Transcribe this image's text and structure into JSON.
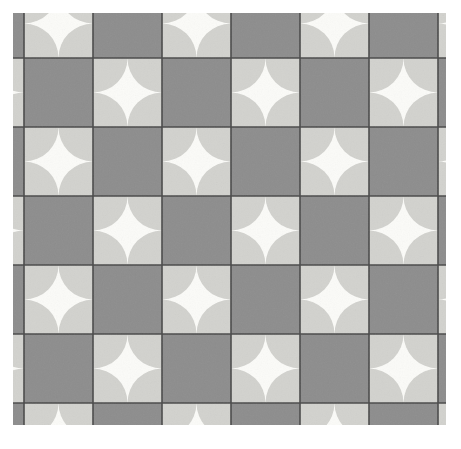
{
  "figure": {
    "kind": "geometric-tiling",
    "canvas": {
      "width": 461,
      "height": 449,
      "background": "#ffffff"
    }
  },
  "viewport": {
    "x": 13,
    "y": 13,
    "width": 433,
    "height": 412,
    "label": "clipped pattern region"
  },
  "grid": {
    "cell_size": 69,
    "origin_x": 24,
    "origin_y": 58,
    "columns": 7,
    "rows": 7,
    "line_color": "#4a4a4a",
    "line_width": 1.6,
    "vertical_lines": [
      24,
      93,
      162,
      231,
      300,
      369,
      438
    ],
    "horizontal_lines": [
      58,
      127,
      196,
      265,
      334,
      403
    ]
  },
  "colors": {
    "dark_tile": "#8d8d8d",
    "light_tile": "#d2d2ce",
    "star_fill": "#fbfbf8",
    "grid_line": "#4a4a4a",
    "page_background": "#ffffff",
    "grain": "#9a9a95"
  },
  "motif": {
    "name": "astroid-star",
    "description": "Four quarter-circle arcs inset from the tile corners carve a concave four-pointed white star.",
    "corner_radius_ratio": 0.5
  },
  "parity": {
    "description": "Checkerboard: tiles where (column + row) is even are dark solid; odd tiles are light with a white astroid star.",
    "dark_when_sum_even": true
  },
  "legend": {
    "dark_label": "solid dark tile",
    "light_label": "light tile with white star",
    "visible": false
  }
}
